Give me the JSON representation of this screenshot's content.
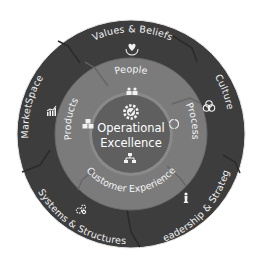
{
  "diagram": {
    "type": "concentric-wheel",
    "colors": {
      "outer_ring": "#3d3d3d",
      "outer_ring_seam": "#2c2c2c",
      "middle_ring": "#7a7a7a",
      "middle_ring_seam": "#686868",
      "center": "#5e5e5e",
      "center_border": "#8c8c8c",
      "text": "#f2f2f2",
      "background": "#ffffff"
    },
    "center": {
      "line1": "Operational",
      "line2": "Excellence",
      "icon": "gear-check-icon"
    },
    "middle_ring": [
      {
        "label": "People",
        "icon": "people-icon"
      },
      {
        "label": "Process",
        "icon": "cycle-icon"
      },
      {
        "label": "Customer Experience",
        "icon": "org-chart-icon"
      },
      {
        "label": "Products",
        "icon": "cubes-icon"
      }
    ],
    "outer_ring": [
      {
        "label": "Values & Beliefs",
        "icon": "heart-hands-icon"
      },
      {
        "label": "Culture",
        "icon": "interlocking-circles-icon"
      },
      {
        "label": "Leadership & Strategy",
        "icon": "chess-piece-icon"
      },
      {
        "label": "Systems & Structures",
        "icon": "gears-icon"
      },
      {
        "label": "MarketSpace",
        "icon": "bar-chart-icon"
      }
    ]
  }
}
